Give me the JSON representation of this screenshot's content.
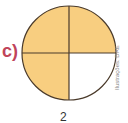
{
  "figure": {
    "label": "c)",
    "credit": "Ilustrações: DAE",
    "bottom_text": "2",
    "circle": {
      "parts": 4,
      "shaded_parts": 3,
      "fill_color": "#f8ce80",
      "empty_color": "#ffffff",
      "line_color": "#4a3a2a",
      "shaded_quadrants": [
        "top-left",
        "top-right",
        "bottom-left"
      ],
      "unshaded_quadrants": [
        "bottom-right"
      ]
    }
  }
}
